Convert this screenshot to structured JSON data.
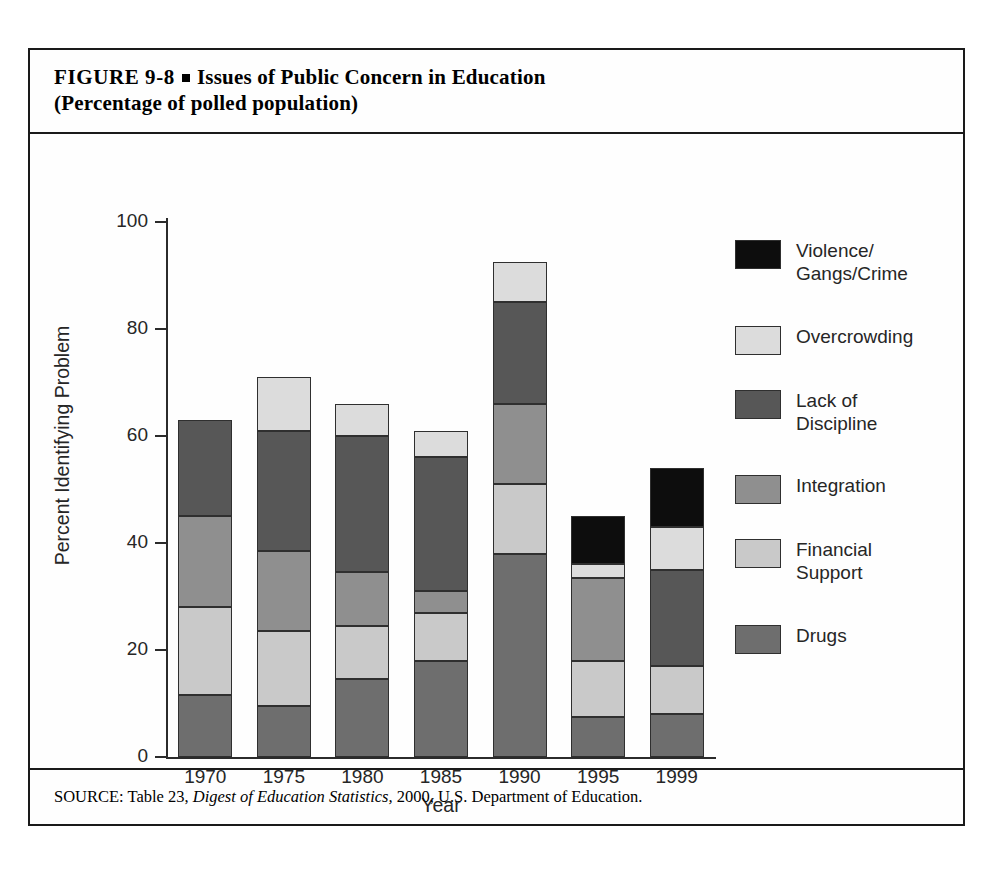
{
  "figure": {
    "label": "FIGURE  9-8",
    "bullet": "square-bullet",
    "title_line1": "Issues of Public Concern in Education",
    "title_line2": "(Percentage of polled population)",
    "source_prefix": "SOURCE: Table 23, ",
    "source_italic": "Digest of Education Statistics,",
    "source_suffix": " 2000, U.S. Department of Education."
  },
  "chart_data": {
    "type": "bar",
    "subtype": "stacked-bar",
    "title": "Issues of Public Concern in Education (Percentage of polled population)",
    "xlabel": "Year",
    "ylabel": "Percent Identifying Problem",
    "categories": [
      "1970",
      "1975",
      "1980",
      "1985",
      "1990",
      "1995",
      "1999"
    ],
    "ylim": [
      0,
      100
    ],
    "yticks": [
      0,
      20,
      40,
      60,
      80,
      100
    ],
    "ytick_labels": [
      "0",
      "20",
      "40",
      "60",
      "80",
      "100"
    ],
    "grid": false,
    "legend_position": "right",
    "stack_order_bottom_to_top": [
      "Drugs",
      "Financial Support",
      "Integration",
      "Lack of Discipline",
      "Overcrowding",
      "Violence/Gangs/Crime"
    ],
    "series": [
      {
        "name": "Drugs",
        "color": "#6e6e6e",
        "values": [
          11.5,
          9.5,
          14.5,
          18.0,
          38.0,
          7.5,
          8.0
        ]
      },
      {
        "name": "Financial Support",
        "color": "#c9c9c9",
        "values": [
          16.5,
          14.0,
          10.0,
          9.0,
          13.0,
          10.5,
          9.0
        ]
      },
      {
        "name": "Integration",
        "color": "#8f8f8f",
        "values": [
          17.0,
          15.0,
          10.0,
          4.0,
          15.0,
          15.5,
          0.0
        ]
      },
      {
        "name": "Lack of Discipline",
        "color": "#575757",
        "values": [
          18.0,
          22.5,
          25.5,
          25.0,
          19.0,
          0.0,
          18.0
        ]
      },
      {
        "name": "Overcrowding",
        "color": "#dcdcdc",
        "values": [
          0.0,
          10.0,
          6.0,
          5.0,
          7.5,
          2.5,
          8.0
        ]
      },
      {
        "name": "Violence/Gangs/Crime",
        "color": "#0d0d0d",
        "values": [
          0.0,
          0.0,
          0.0,
          0.0,
          0.0,
          9.0,
          11.0
        ]
      }
    ],
    "totals": [
      63,
      71,
      66,
      61,
      92.5,
      45,
      54
    ]
  },
  "legend": {
    "entries": [
      {
        "label": "Violence/\nGangs/Crime",
        "color": "#0d0d0d",
        "swatch_name": "legend-swatch-violence"
      },
      {
        "label": "Overcrowding",
        "color": "#dcdcdc",
        "swatch_name": "legend-swatch-overcrowding"
      },
      {
        "label": "Lack of\nDiscipline",
        "color": "#575757",
        "swatch_name": "legend-swatch-discipline"
      },
      {
        "label": "Integration",
        "color": "#8f8f8f",
        "swatch_name": "legend-swatch-integration"
      },
      {
        "label": "Financial\nSupport",
        "color": "#c9c9c9",
        "swatch_name": "legend-swatch-financial"
      },
      {
        "label": "Drugs",
        "color": "#6e6e6e",
        "swatch_name": "legend-swatch-drugs"
      }
    ]
  }
}
